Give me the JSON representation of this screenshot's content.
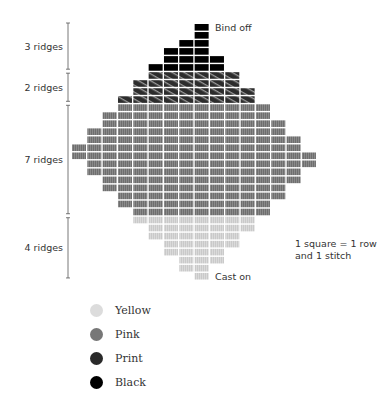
{
  "annotations": {
    "top": "Bind off",
    "bottom": "Cast on",
    "note_line1": "1 square = 1 row",
    "note_line2": "and 1 stitch"
  },
  "sections": [
    {
      "label": "3 ridges",
      "color": "Black",
      "rows": [
        [
          8,
          8
        ],
        [
          8,
          8
        ],
        [
          7,
          8
        ],
        [
          6,
          8
        ],
        [
          6,
          9
        ],
        [
          5,
          9
        ]
      ]
    },
    {
      "label": "2 ridges",
      "color": "Print",
      "rows": [
        [
          5,
          10
        ],
        [
          4,
          10
        ],
        [
          4,
          11
        ],
        [
          3,
          11
        ]
      ]
    },
    {
      "label": "7 ridges",
      "color": "Pink",
      "rows": [
        [
          3,
          12
        ],
        [
          2,
          12
        ],
        [
          2,
          13
        ],
        [
          1,
          13
        ],
        [
          1,
          14
        ],
        [
          0,
          14
        ],
        [
          0,
          15
        ],
        [
          1,
          15
        ],
        [
          1,
          14
        ],
        [
          2,
          14
        ],
        [
          2,
          13
        ],
        [
          3,
          13
        ],
        [
          3,
          12
        ],
        [
          4,
          12
        ]
      ]
    },
    {
      "label": "4 ridges",
      "color": "Yellow",
      "rows": [
        [
          4,
          11
        ],
        [
          5,
          11
        ],
        [
          5,
          10
        ],
        [
          6,
          10
        ],
        [
          6,
          9
        ],
        [
          7,
          9
        ],
        [
          7,
          8
        ],
        [
          8,
          8
        ]
      ]
    }
  ],
  "legend": [
    {
      "label": "Yellow",
      "hex": "#d4d4d4"
    },
    {
      "label": "Pink",
      "hex": "#777777"
    },
    {
      "label": "Print",
      "hex": "#2a2a2a"
    },
    {
      "label": "Black",
      "hex": "#000000"
    }
  ]
}
